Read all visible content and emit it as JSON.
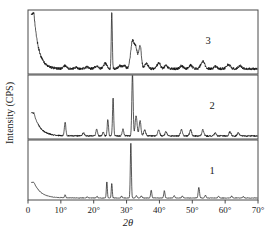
{
  "figure": {
    "type": "xrd-diffractogram",
    "background_color": "#ffffff",
    "trace_color": "#121212",
    "frame_color": "#4a4a4a"
  },
  "axes": {
    "x_title": "2θ",
    "y_title": "Intensity (CPS)",
    "x_ticks": [
      "0",
      "10°",
      "20°",
      "30°",
      "40°",
      "50°",
      "60°",
      "70°"
    ],
    "x_tick_values": [
      0,
      10,
      20,
      30,
      40,
      50,
      60,
      70
    ],
    "x_min": 0,
    "x_max": 70
  },
  "panels": [
    {
      "label": "3"
    },
    {
      "label": "2"
    },
    {
      "label": "1"
    }
  ],
  "chart_data": {
    "type": "line",
    "title": "",
    "xlabel": "2θ",
    "ylabel": "Intensity (CPS)",
    "xlim": [
      0,
      70
    ],
    "ylim": [
      0,
      1
    ],
    "grid": false,
    "legend": "none",
    "panel_layout": "3 stacked panels sharing one 2θ axis, labelled 3 (top), 2 (middle), 1 (bottom)",
    "series": [
      {
        "name": "3",
        "panel": 0,
        "description": "Broad amorphous background with steep small-angle decay; broad hump 31-35 degrees; sharp quartz-like line at 25.5 degrees",
        "baseline": 0.07,
        "noise": 0.022,
        "small_angle_decay": {
          "amplitude": 0.92,
          "decay_constant": 1.45,
          "onset": 1.8
        },
        "peaks": [
          {
            "two_theta": 11.3,
            "height": 0.05,
            "width": 0.45
          },
          {
            "two_theta": 14.6,
            "height": 0.025,
            "width": 0.5
          },
          {
            "two_theta": 18.0,
            "height": 0.03,
            "width": 0.6
          },
          {
            "two_theta": 20.8,
            "height": 0.04,
            "width": 0.55
          },
          {
            "two_theta": 23.5,
            "height": 0.09,
            "width": 0.5
          },
          {
            "two_theta": 25.5,
            "height": 0.93,
            "width": 0.16
          },
          {
            "two_theta": 28.0,
            "height": 0.05,
            "width": 0.5
          },
          {
            "two_theta": 29.3,
            "height": 0.05,
            "width": 0.45
          },
          {
            "two_theta": 31.8,
            "height": 0.46,
            "width": 0.55
          },
          {
            "two_theta": 32.9,
            "height": 0.3,
            "width": 0.45
          },
          {
            "two_theta": 34.1,
            "height": 0.39,
            "width": 0.4
          },
          {
            "two_theta": 36.0,
            "height": 0.09,
            "width": 0.5
          },
          {
            "two_theta": 39.8,
            "height": 0.1,
            "width": 0.5
          },
          {
            "two_theta": 42.0,
            "height": 0.05,
            "width": 0.5
          },
          {
            "two_theta": 46.7,
            "height": 0.05,
            "width": 0.5
          },
          {
            "two_theta": 49.5,
            "height": 0.06,
            "width": 0.5
          },
          {
            "two_theta": 53.2,
            "height": 0.12,
            "width": 0.6
          },
          {
            "two_theta": 57.0,
            "height": 0.04,
            "width": 0.5
          },
          {
            "two_theta": 61.0,
            "height": 0.07,
            "width": 0.6
          },
          {
            "two_theta": 64.5,
            "height": 0.05,
            "width": 0.5
          }
        ]
      },
      {
        "name": "2",
        "panel": 1,
        "description": "Crystalline apatite pattern on low amorphous background; dominant 31.8 degree reflection clipped at panel top; sharp 25.9 degree line",
        "baseline": 0.035,
        "noise": 0.012,
        "small_angle_decay": {
          "amplitude": 0.38,
          "decay_constant": 1.9,
          "onset": 1.8
        },
        "peaks": [
          {
            "two_theta": 11.3,
            "height": 0.22,
            "width": 0.22
          },
          {
            "two_theta": 16.9,
            "height": 0.05,
            "width": 0.3
          },
          {
            "two_theta": 20.9,
            "height": 0.11,
            "width": 0.25
          },
          {
            "two_theta": 22.9,
            "height": 0.06,
            "width": 0.25
          },
          {
            "two_theta": 24.3,
            "height": 0.27,
            "width": 0.2
          },
          {
            "two_theta": 25.9,
            "height": 0.62,
            "width": 0.18
          },
          {
            "two_theta": 28.9,
            "height": 0.11,
            "width": 0.25
          },
          {
            "two_theta": 31.8,
            "height": 1.05,
            "width": 0.2
          },
          {
            "two_theta": 32.9,
            "height": 0.33,
            "width": 0.3
          },
          {
            "two_theta": 34.1,
            "height": 0.25,
            "width": 0.28
          },
          {
            "two_theta": 35.5,
            "height": 0.1,
            "width": 0.3
          },
          {
            "two_theta": 39.8,
            "height": 0.1,
            "width": 0.3
          },
          {
            "two_theta": 42.0,
            "height": 0.07,
            "width": 0.3
          },
          {
            "two_theta": 46.7,
            "height": 0.1,
            "width": 0.3
          },
          {
            "two_theta": 49.5,
            "height": 0.1,
            "width": 0.3
          },
          {
            "two_theta": 53.2,
            "height": 0.1,
            "width": 0.3
          },
          {
            "two_theta": 57.0,
            "height": 0.05,
            "width": 0.3
          },
          {
            "two_theta": 61.5,
            "height": 0.07,
            "width": 0.3
          },
          {
            "two_theta": 64.0,
            "height": 0.05,
            "width": 0.3
          }
        ]
      },
      {
        "name": "1",
        "panel": 2,
        "description": "Sharp well-crystallised pattern, flat baseline, very intense 31.3 degree reflection",
        "baseline": 0.018,
        "noise": 0.004,
        "small_angle_decay": {
          "amplitude": 0.28,
          "decay_constant": 2.1,
          "onset": 1.8
        },
        "peaks": [
          {
            "two_theta": 11.3,
            "height": 0.055,
            "width": 0.17
          },
          {
            "two_theta": 18.0,
            "height": 0.02,
            "width": 0.2
          },
          {
            "two_theta": 21.0,
            "height": 0.03,
            "width": 0.18
          },
          {
            "two_theta": 24.0,
            "height": 0.29,
            "width": 0.15
          },
          {
            "two_theta": 25.5,
            "height": 0.26,
            "width": 0.15
          },
          {
            "two_theta": 28.5,
            "height": 0.035,
            "width": 0.18
          },
          {
            "two_theta": 31.3,
            "height": 0.98,
            "width": 0.16
          },
          {
            "two_theta": 33.0,
            "height": 0.045,
            "width": 0.2
          },
          {
            "two_theta": 34.5,
            "height": 0.035,
            "width": 0.2
          },
          {
            "two_theta": 37.5,
            "height": 0.14,
            "width": 0.18
          },
          {
            "two_theta": 41.5,
            "height": 0.13,
            "width": 0.18
          },
          {
            "two_theta": 44.5,
            "height": 0.04,
            "width": 0.2
          },
          {
            "two_theta": 47.0,
            "height": 0.035,
            "width": 0.2
          },
          {
            "two_theta": 52.0,
            "height": 0.19,
            "width": 0.2
          },
          {
            "two_theta": 54.0,
            "height": 0.05,
            "width": 0.2
          },
          {
            "two_theta": 58.0,
            "height": 0.03,
            "width": 0.2
          },
          {
            "two_theta": 62.0,
            "height": 0.035,
            "width": 0.2
          },
          {
            "two_theta": 65.5,
            "height": 0.025,
            "width": 0.2
          }
        ]
      }
    ]
  }
}
